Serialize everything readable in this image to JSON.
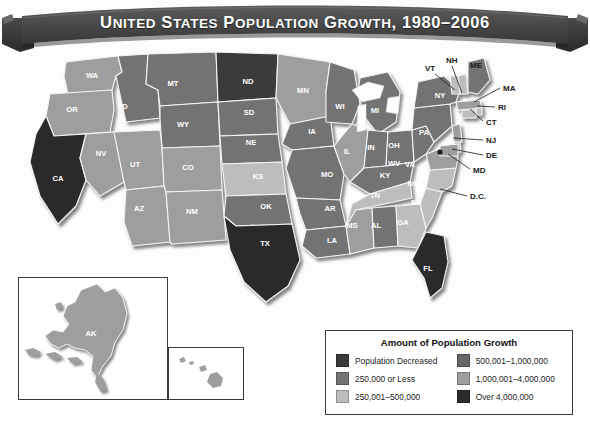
{
  "banner": {
    "title": "United States Population Growth, 1980–2006",
    "color": "#4a4a4a",
    "shadow_color": "#2e2e2e"
  },
  "legend": {
    "title": "Amount of Population Growth",
    "left_column": [
      {
        "label": "Population Decreased",
        "color": "#3a3a3a",
        "tier": "decreased"
      },
      {
        "label": "250,000 or Less",
        "color": "#737373",
        "tier": "t1"
      },
      {
        "label": "250,001–500,000",
        "color": "#bdbdbd",
        "tier": "t2"
      }
    ],
    "right_column": [
      {
        "label": "500,001–1,000,000",
        "color": "#666666",
        "tier": "t3"
      },
      {
        "label": "1,000,001–4,000,000",
        "color": "#9e9e9e",
        "tier": "t4"
      },
      {
        "label": "Over 4,000,000",
        "color": "#2b2b2b",
        "tier": "t5"
      }
    ]
  },
  "map": {
    "inset_ak_label": "AK",
    "inset_hi_label": "HI",
    "tier_colors": {
      "decreased": "#3a3a3a",
      "t1": "#737373",
      "t2": "#bdbdbd",
      "t3": "#666666",
      "t4": "#9e9e9e",
      "t5": "#2b2b2b"
    },
    "states": [
      {
        "code": "WA",
        "tier": "t4",
        "label_x": 92,
        "label_y": 32
      },
      {
        "code": "OR",
        "tier": "t4",
        "label_x": 72,
        "label_y": 66
      },
      {
        "code": "CA",
        "tier": "t5",
        "label_x": 58,
        "label_y": 135
      },
      {
        "code": "NV",
        "tier": "t4",
        "label_x": 101,
        "label_y": 110
      },
      {
        "code": "ID",
        "tier": "t1",
        "label_x": 124,
        "label_y": 63
      },
      {
        "code": "MT",
        "tier": "t1",
        "label_x": 173,
        "label_y": 40
      },
      {
        "code": "WY",
        "tier": "t1",
        "label_x": 183,
        "label_y": 81
      },
      {
        "code": "UT",
        "tier": "t4",
        "label_x": 135,
        "label_y": 121
      },
      {
        "code": "CO",
        "tier": "t4",
        "label_x": 188,
        "label_y": 124
      },
      {
        "code": "AZ",
        "tier": "t4",
        "label_x": 139,
        "label_y": 165
      },
      {
        "code": "NM",
        "tier": "t4",
        "label_x": 192,
        "label_y": 168
      },
      {
        "code": "ND",
        "tier": "decreased",
        "label_x": 248,
        "label_y": 38
      },
      {
        "code": "SD",
        "tier": "t1",
        "label_x": 249,
        "label_y": 69
      },
      {
        "code": "NE",
        "tier": "t1",
        "label_x": 251,
        "label_y": 99
      },
      {
        "code": "KS",
        "tier": "t2",
        "label_x": 258,
        "label_y": 133
      },
      {
        "code": "OK",
        "tier": "t1",
        "label_x": 266,
        "label_y": 163
      },
      {
        "code": "TX",
        "tier": "t5",
        "label_x": 265,
        "label_y": 200
      },
      {
        "code": "MN",
        "tier": "t4",
        "label_x": 303,
        "label_y": 47
      },
      {
        "code": "IA",
        "tier": "t1",
        "label_x": 312,
        "label_y": 88
      },
      {
        "code": "MO",
        "tier": "t1",
        "label_x": 327,
        "label_y": 131
      },
      {
        "code": "AR",
        "tier": "t1",
        "label_x": 330,
        "label_y": 165
      },
      {
        "code": "LA",
        "tier": "t1",
        "label_x": 332,
        "label_y": 197
      },
      {
        "code": "WI",
        "tier": "t1",
        "label_x": 340,
        "label_y": 63
      },
      {
        "code": "IL",
        "tier": "t4",
        "label_x": 347,
        "label_y": 108
      },
      {
        "code": "MI",
        "tier": "t1",
        "label_x": 375,
        "label_y": 67
      },
      {
        "code": "IN",
        "tier": "t1",
        "label_x": 371,
        "label_y": 104
      },
      {
        "code": "OH",
        "tier": "t1",
        "label_x": 394,
        "label_y": 102
      },
      {
        "code": "KY",
        "tier": "t1",
        "label_x": 385,
        "label_y": 132
      },
      {
        "code": "TN",
        "tier": "t2",
        "label_x": 375,
        "label_y": 152
      },
      {
        "code": "MS",
        "tier": "t4",
        "label_x": 352,
        "label_y": 182
      },
      {
        "code": "AL",
        "tier": "t1",
        "label_x": 376,
        "label_y": 182
      },
      {
        "code": "GA",
        "tier": "t2",
        "label_x": 403,
        "label_y": 179
      },
      {
        "code": "FL",
        "tier": "t5",
        "label_x": 428,
        "label_y": 225
      },
      {
        "code": "SC",
        "tier": "t2",
        "label_x": 416,
        "label_y": 159
      },
      {
        "code": "NC",
        "tier": "t2",
        "label_x": 413,
        "label_y": 140
      },
      {
        "code": "VA",
        "tier": "t4",
        "label_x": 410,
        "label_y": 121
      },
      {
        "code": "WV",
        "tier": "t1",
        "label_x": 394,
        "label_y": 120
      },
      {
        "code": "PA",
        "tier": "t1",
        "label_x": 424,
        "label_y": 89
      },
      {
        "code": "NY",
        "tier": "t1",
        "label_x": 440,
        "label_y": 52
      }
    ],
    "callouts": [
      {
        "code": "NH",
        "text_x": 446,
        "text_y": 17,
        "lx1": 452,
        "ly1": 20,
        "lx2": 462,
        "ly2": 47
      },
      {
        "code": "VT",
        "text_x": 425,
        "text_y": 25,
        "lx1": 435,
        "ly1": 28,
        "lx2": 455,
        "ly2": 44
      },
      {
        "code": "ME",
        "text_x": 470,
        "text_y": 22,
        "lx1": 470,
        "ly1": 22,
        "lx2": 470,
        "ly2": 22
      },
      {
        "code": "MA",
        "text_x": 503,
        "text_y": 45,
        "lx1": 500,
        "ly1": 42,
        "lx2": 474,
        "ly2": 56
      },
      {
        "code": "RI",
        "text_x": 498,
        "text_y": 64,
        "lx1": 495,
        "ly1": 61,
        "lx2": 477,
        "ly2": 60
      },
      {
        "code": "CT",
        "text_x": 486,
        "text_y": 79,
        "lx1": 483,
        "ly1": 75,
        "lx2": 470,
        "ly2": 63
      },
      {
        "code": "NJ",
        "text_x": 486,
        "text_y": 97,
        "lx1": 483,
        "ly1": 94,
        "lx2": 453,
        "ly2": 92
      },
      {
        "code": "DE",
        "text_x": 486,
        "text_y": 112,
        "lx1": 483,
        "ly1": 109,
        "lx2": 452,
        "ly2": 103
      },
      {
        "code": "MD",
        "text_x": 473,
        "text_y": 127,
        "lx1": 470,
        "ly1": 123,
        "lx2": 448,
        "ly2": 108
      },
      {
        "code": "D.C.",
        "text_x": 470,
        "text_y": 153,
        "lx1": 467,
        "ly1": 150,
        "lx2": 440,
        "ly2": 143
      }
    ]
  }
}
